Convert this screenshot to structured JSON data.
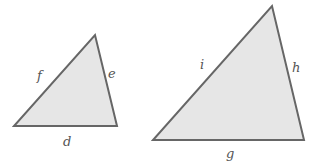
{
  "diagram": {
    "fill_color": "#e6e6e6",
    "stroke_color": "#666666",
    "triangles": [
      {
        "name": "small",
        "points": "14,126 117,126 95,35",
        "labels": {
          "bottom": "d",
          "right": "e",
          "left": "f"
        }
      },
      {
        "name": "large",
        "points": "153,140 304,140 272,6",
        "labels": {
          "bottom": "g",
          "right": "h",
          "left": "i"
        }
      }
    ]
  }
}
